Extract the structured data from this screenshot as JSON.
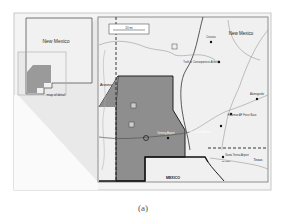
{
  "figure": {
    "caption": "(a)",
    "inset": {
      "state_label": "New Mexico",
      "detail_label": "map of detail"
    },
    "map": {
      "scale_bar_label": "20 mi",
      "region_labels": {
        "new_mexico": "New Mexico",
        "arizona": "Arizona",
        "mexico": "MEXICO",
        "texas": "Texas"
      },
      "places": [
        {
          "name": "Crosses",
          "type": "city"
        },
        {
          "name": "Truth or Consequences Airfield",
          "type": "city"
        },
        {
          "name": "Alamogordo",
          "type": "city"
        },
        {
          "name": "Holloman AF Force Base",
          "type": "city"
        },
        {
          "name": "Las Cruces Airfield",
          "type": "city"
        },
        {
          "name": "Deming Airport",
          "type": "city"
        },
        {
          "name": "Santa Teresa Airport",
          "type": "city"
        },
        {
          "name": "El Paso",
          "type": "city"
        }
      ],
      "colors": {
        "detail_region": "#8e8e8e",
        "background": "#ececec",
        "border": "#333333",
        "roads": "#9a9a9a"
      }
    }
  }
}
